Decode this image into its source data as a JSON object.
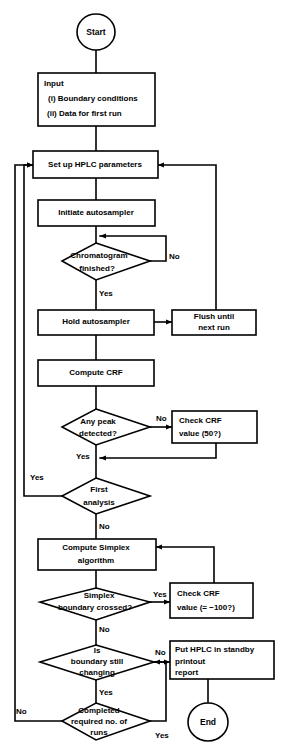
{
  "diagram": {
    "type": "flowchart",
    "background_color": "#ffffff",
    "line_color": "#000000"
  },
  "nodes": {
    "start": {
      "label": "Start",
      "shape": "terminator"
    },
    "input": {
      "shape": "process",
      "line1": "Input",
      "line2": "(i)  Boundary conditions",
      "line3": "(ii)  Data for first run"
    },
    "setup_hplc": {
      "shape": "process",
      "label": "Set up HPLC parameters"
    },
    "initiate_autosampler": {
      "shape": "process",
      "label": "Initiate autosampler"
    },
    "chromatogram_finished": {
      "shape": "decision",
      "line1": "Chromatogram",
      "line2": "finished?"
    },
    "hold_autosampler": {
      "shape": "process",
      "label": "Hold autosampler"
    },
    "flush_until_next_run": {
      "shape": "process",
      "line1": "Flush until",
      "line2": "next run"
    },
    "compute_crf": {
      "shape": "process",
      "label": "Compute CRF"
    },
    "any_peak_detected": {
      "shape": "decision",
      "line1": "Any peak",
      "line2": "detected?"
    },
    "check_crf_50": {
      "shape": "process",
      "line1": "Check CRF",
      "line2": "value (50?)"
    },
    "first_analysis": {
      "shape": "decision",
      "line1": "First",
      "line2": "analysis"
    },
    "compute_simplex": {
      "shape": "process",
      "line1": "Compute Simplex",
      "line2": "algorithm"
    },
    "simplex_boundary_crossed": {
      "shape": "decision",
      "line1": "Simplex",
      "line2": "boundary crossed?"
    },
    "check_crf_minus100": {
      "shape": "process",
      "line1": "Check CRF",
      "line2": "value (= −100?)"
    },
    "boundary_still_changing": {
      "shape": "decision",
      "line1": "Is",
      "line2": "boundary still",
      "line3": "changing"
    },
    "put_hplc_standby": {
      "shape": "process",
      "line1": "Put HPLC in standby",
      "line2": "printout",
      "line3": "report"
    },
    "completed_required_runs": {
      "shape": "decision",
      "line1": "Completed",
      "line2": "required no. of",
      "line3": "runs"
    },
    "end": {
      "label": "End",
      "shape": "terminator"
    }
  },
  "edge_labels": {
    "chromatogram_no": "No",
    "chromatogram_yes": "Yes",
    "any_peak_no": "No",
    "any_peak_yes": "Yes",
    "first_analysis_yes": "Yes",
    "first_analysis_no": "No",
    "simplex_boundary_yes": "Yes",
    "simplex_boundary_no": "No",
    "boundary_changing_no": "No",
    "boundary_changing_yes": "Yes",
    "completed_runs_no": "No",
    "completed_runs_yes": "Yes"
  }
}
